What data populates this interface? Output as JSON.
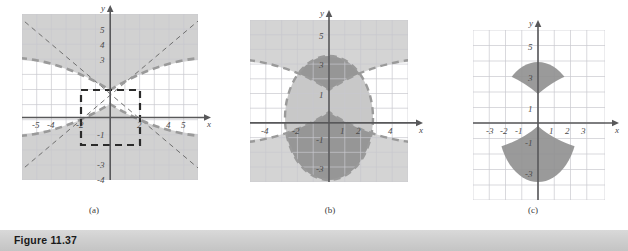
{
  "figure": {
    "banner_label": "Figure 11.37",
    "banner_color": "#cfcfcf"
  },
  "colors": {
    "grid_line": "#c9c9cf",
    "grid_bg": "#ffffff",
    "shade_light": "#c8c8c8",
    "shade_dark": "#9b9b9b",
    "axis": "#58585a",
    "curve_dash": "#9a9a9a",
    "rect_dash": "#2b2b2b",
    "tick_text": "#4a4a4a"
  },
  "panels": [
    {
      "id": "a",
      "caption": "(a)",
      "axis_x_label": "x",
      "axis_y_label": "y",
      "x_ticks": [
        "-5",
        "-4",
        "-2",
        "2",
        "4",
        "5"
      ],
      "x_tick_values": [
        -5,
        -4,
        -2,
        2,
        4,
        5
      ],
      "y_ticks": [
        "5",
        "4",
        "3",
        "-1",
        "-3",
        "-4"
      ],
      "y_tick_values": [
        5,
        4,
        3,
        -1,
        -3,
        -4
      ],
      "xlim": [
        -6,
        6
      ],
      "ylim": [
        -5,
        6
      ],
      "description": "Hyperbola opening up and down with dashed boundary, exterior shaded, asymptotes dashed, central dashed reference rectangle",
      "hyperbola": {
        "a": 2.5,
        "b": 2.5,
        "orientation": "vertical"
      },
      "rectangle": {
        "x": [
          -2,
          2
        ],
        "y": [
          -2.5,
          2.5
        ]
      }
    },
    {
      "id": "b",
      "caption": "(b)",
      "axis_x_label": "x",
      "axis_y_label": "y",
      "x_ticks": [
        "-4",
        "-2",
        "1",
        "2",
        "4"
      ],
      "x_tick_values": [
        -4,
        -2,
        1,
        2,
        4
      ],
      "y_ticks": [
        "5",
        "3",
        "1",
        "-1",
        "-3"
      ],
      "y_tick_values": [
        5,
        3,
        1,
        -1,
        -3
      ],
      "xlim": [
        -5.5,
        5.5
      ],
      "ylim": [
        -5,
        6
      ],
      "description": "Shaded ellipse interior overlapping the shaded hyperbola exterior; overlap regions are darker",
      "ellipse": {
        "a": 2.8,
        "b": 4.0
      },
      "hyperbola": {
        "a": 2.5,
        "b": 2.5,
        "orientation": "vertical"
      }
    },
    {
      "id": "c",
      "caption": "(c)",
      "axis_x_label": "x",
      "axis_y_label": "y",
      "x_ticks": [
        "-3",
        "-2",
        "-1",
        "1",
        "2",
        "3"
      ],
      "x_tick_values": [
        -3,
        -2,
        -1,
        1,
        2,
        3
      ],
      "y_ticks": [
        "5",
        "3",
        "1",
        "-1",
        "-3"
      ],
      "y_tick_values": [
        5,
        3,
        1,
        -1,
        -3
      ],
      "xlim": [
        -4.5,
        4.5
      ],
      "ylim": [
        -5,
        6
      ],
      "description": "Only the intersection of the ellipse interior and hyperbola exterior: two lens shaped regions above and below the x-axis",
      "ellipse": {
        "a": 2.8,
        "b": 4.0
      },
      "hyperbola": {
        "a": 2.5,
        "b": 2.5,
        "orientation": "vertical"
      }
    }
  ]
}
